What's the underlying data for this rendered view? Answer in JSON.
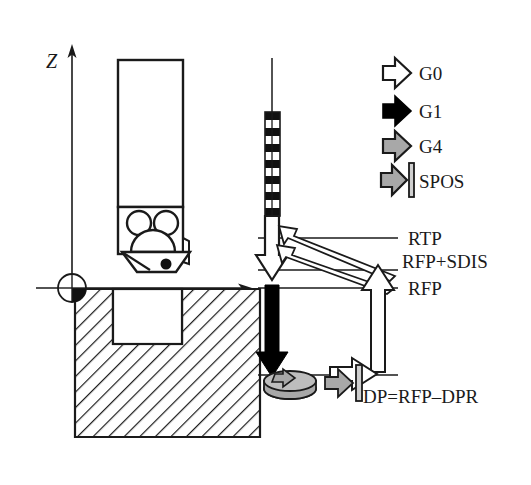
{
  "figure": {
    "axes": {
      "vertical_label": "Z",
      "horizontal_label": "X"
    },
    "colors": {
      "line": "#1a1a1a",
      "g0_fill": "#ffffff",
      "g1_fill": "#000000",
      "g4_fill": "#a8a8a8",
      "spos_fill": "#a8a8a8",
      "hatch": "#1a1a1a",
      "background": "#ffffff"
    }
  },
  "legend": {
    "items": [
      {
        "label": "G0",
        "icon": "arrow-right-outline-icon",
        "fill": "#ffffff"
      },
      {
        "label": "G1",
        "icon": "arrow-right-solid-icon",
        "fill": "#000000"
      },
      {
        "label": "G4",
        "icon": "arrow-right-gray-icon",
        "fill": "#a8a8a8"
      },
      {
        "label": "SPOS",
        "icon": "arrow-right-gray-bar-icon",
        "fill": "#a8a8a8"
      }
    ]
  },
  "levels": {
    "rtp": "RTP",
    "rfp_sdis": "RFP+SDIS",
    "rfp": "RFP",
    "dp": "DP=RFP–DPR"
  },
  "workpiece": {
    "name": "hatched-workpiece-section",
    "zero_symbol": "workpiece-zero-icon"
  },
  "tool": {
    "name": "drill-tool-holder",
    "tip_marker": "tool-tip-dot"
  },
  "motion": {
    "rapid_band": "dashed-rapid-traverse-band",
    "g0_down": "g0-approach-arrow",
    "g1_down": "g1-feed-arrow",
    "g4_dwell": "g4-dwell-disc-icon",
    "spos_stop": "spos-oriented-stop-icon",
    "g0_retract": "g0-retract-arrow",
    "g0_return_upper": "g0-return-arrow-upper",
    "g0_return_lower": "g0-return-arrow-lower",
    "g0_exit": "g0-exit-arrow"
  }
}
